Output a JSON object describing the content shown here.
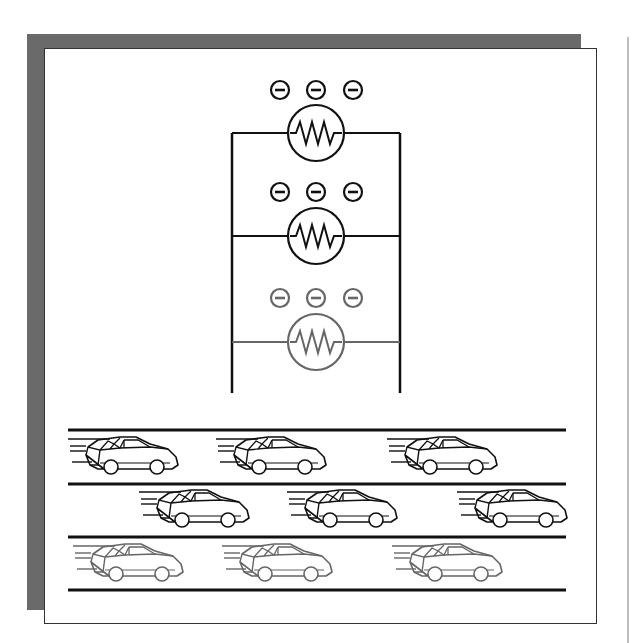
{
  "figure": {
    "colors": {
      "shadow": "#6a6a6a",
      "ink": "#111111",
      "faded_ink": "#666666",
      "edge_line": "#bdbdbd"
    }
  },
  "circuit": {
    "rail_left_x": 232,
    "rail_right_x": 400,
    "rail_top_y": 133,
    "rail_bottom_y": 393,
    "branches": [
      {
        "y": 133,
        "resistor_cx": 316,
        "resistor_r": 28,
        "electron_y": 90,
        "electrons": [
          "−",
          "−",
          "−"
        ],
        "color": "#111111"
      },
      {
        "y": 236,
        "resistor_cx": 316,
        "resistor_r": 28,
        "electron_y": 192,
        "electrons": [
          "−",
          "−",
          "−"
        ],
        "color": "#111111"
      },
      {
        "y": 342,
        "resistor_cx": 316,
        "resistor_r": 28,
        "electron_y": 298,
        "electrons": [
          "−",
          "−",
          "−"
        ],
        "color": "#666666"
      }
    ]
  },
  "traffic": {
    "lane_lines_y": [
      430,
      484,
      537,
      590
    ],
    "lane_x_start": 68,
    "lane_x_end": 566,
    "lanes": [
      {
        "cars_x": [
          82,
          230,
          401
        ],
        "car_top_y": 435,
        "color": "#111111"
      },
      {
        "cars_x": [
          154,
          302,
          472
        ],
        "car_top_y": 488,
        "color": "#111111"
      },
      {
        "cars_x": [
          87,
          236,
          406
        ],
        "car_top_y": 541,
        "color": "#666666"
      }
    ]
  }
}
